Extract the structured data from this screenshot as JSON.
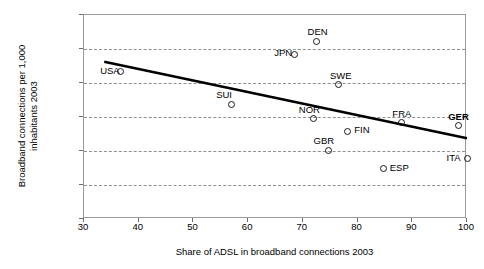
{
  "chart_data": {
    "type": "scatter",
    "title": "",
    "xlabel": "Share of ADSL in broadband connections 2003",
    "ylabel": "Broadband connections per 1,000\ninhabitants 2003",
    "xlim": [
      30,
      100
    ],
    "ylim": [
      0,
      120
    ],
    "xticks": [
      30,
      40,
      50,
      60,
      70,
      80,
      90,
      100
    ],
    "yticks": [
      0,
      20,
      40,
      60,
      80,
      100,
      120
    ],
    "grid": "horizontal-dashed",
    "legend": "none",
    "points": [
      {
        "label": "USA",
        "x": 36.7,
        "y": 86.5,
        "label_pos": "left",
        "bold": false
      },
      {
        "label": "SUI",
        "x": 56.9,
        "y": 67.5,
        "label_pos": "above-left",
        "bold": false
      },
      {
        "label": "JPN",
        "x": 68.5,
        "y": 97.0,
        "label_pos": "left",
        "bold": false
      },
      {
        "label": "DEN",
        "x": 72.5,
        "y": 104.5,
        "label_pos": "above",
        "bold": false
      },
      {
        "label": "NOR",
        "x": 72.0,
        "y": 59.0,
        "label_pos": "above-left",
        "bold": false
      },
      {
        "label": "GBR",
        "x": 74.7,
        "y": 40.5,
        "label_pos": "above-left",
        "bold": false
      },
      {
        "label": "SWE",
        "x": 76.6,
        "y": 79.0,
        "label_pos": "above",
        "bold": false
      },
      {
        "label": "FIN",
        "x": 78.2,
        "y": 51.5,
        "label_pos": "right",
        "bold": false
      },
      {
        "label": "ESP",
        "x": 84.7,
        "y": 29.5,
        "label_pos": "right",
        "bold": false
      },
      {
        "label": "FRA",
        "x": 88.0,
        "y": 56.5,
        "label_pos": "above",
        "bold": false
      },
      {
        "label": "GER",
        "x": 98.4,
        "y": 55.0,
        "label_pos": "above",
        "bold": true
      },
      {
        "label": "ITA",
        "x": 100.0,
        "y": 35.5,
        "label_pos": "left",
        "bold": false
      }
    ],
    "trendline": {
      "x1": 33.7,
      "y1": 92.5,
      "x2": 100.0,
      "y2": 47.5
    },
    "colors": {
      "axis": "#9a9a9a",
      "grid": "#8f8f8f",
      "marker": "#1a1a1a",
      "trend": "#000000",
      "text": "#000000"
    }
  }
}
